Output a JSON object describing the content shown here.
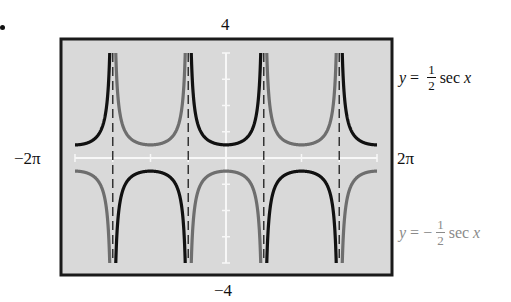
{
  "chart_data": {
    "type": "line",
    "title": "",
    "xlabel": "",
    "ylabel": "",
    "xlim": [
      -6.283185,
      6.283185
    ],
    "ylim": [
      -4,
      4
    ],
    "x_range_labels": {
      "min": "−2π",
      "max": "2π"
    },
    "y_range_labels": {
      "min": "−4",
      "max": "4"
    },
    "grid": false,
    "asymptotes": [
      -4.712389,
      -1.570796,
      1.570796,
      4.712389
    ],
    "series": [
      {
        "name": "y = 1/2 sec x",
        "coefficient": 0.5,
        "function": "sec",
        "color": "#111111",
        "label_position": "right-upper"
      },
      {
        "name": "y = −1/2 sec x",
        "coefficient": -0.5,
        "function": "sec",
        "color": "#6e6e6e",
        "label_position": "right-lower"
      }
    ],
    "sample_points": {
      "x": [
        -6.283,
        -5.498,
        -5.0,
        0.0,
        0.785,
        1.2,
        3.1416,
        4.2,
        5.498,
        6.283
      ],
      "y_half_sec": [
        0.5,
        0.707,
        1.763,
        0.5,
        0.707,
        1.38,
        -0.5,
        -1.02,
        0.707,
        0.5
      ],
      "y_neg_half_sec": [
        -0.5,
        -0.707,
        -1.763,
        -0.5,
        -0.707,
        -1.38,
        0.5,
        1.02,
        -0.707,
        -0.5
      ]
    }
  },
  "labels": {
    "ymax": "4",
    "ymin": "−4",
    "xmin": "−2π",
    "xmax": "2π"
  },
  "equations": {
    "eq1": {
      "lhs": "y",
      "op": "=",
      "sign": "",
      "num": "1",
      "den": "2",
      "fn": "sec",
      "var": "x"
    },
    "eq2": {
      "lhs": "y",
      "op": "=",
      "sign": "−",
      "num": "1",
      "den": "2",
      "fn": "sec",
      "var": "x"
    }
  },
  "colors": {
    "frame": "#1a1a1a",
    "background": "#d9d9d9",
    "axis": "#f7f7f7",
    "asymptote": "#333333"
  }
}
